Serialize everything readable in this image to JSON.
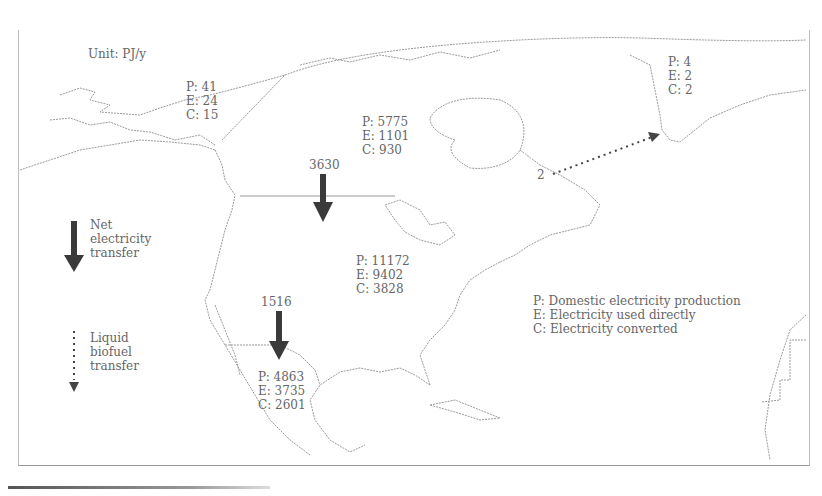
{
  "unit": "Unit: PJ/y",
  "regions": {
    "alaska": {
      "p": "P: 41",
      "e": "E: 24",
      "c": "C: 15"
    },
    "canada": {
      "p": "P: 5775",
      "e": "E: 1101",
      "c": "C: 930"
    },
    "greenland": {
      "p": "P: 4",
      "e": "E: 2",
      "c": "C: 2"
    },
    "usa": {
      "p": "P: 11172",
      "e": "E: 9402",
      "c": "C: 3828"
    },
    "mexico": {
      "p": "P: 4863",
      "e": "E: 3735",
      "c": "C: 2601"
    }
  },
  "transfers": {
    "canada_to_usa": "3630",
    "usa_to_mexico": "1516",
    "biofuel_canada_to_greenland": "2"
  },
  "legend": {
    "net_electricity": [
      "Net",
      "electricity",
      "transfer"
    ],
    "liquid_biofuel": [
      "Liquid",
      "biofuel",
      "transfer"
    ],
    "key": [
      "P: Domestic electricity production",
      "E: Electricity used directly",
      "C: Electricity converted"
    ]
  },
  "colors": {
    "arrow": "#3a3a3a",
    "coastline": "#9a9a9a",
    "text": "#666666"
  }
}
